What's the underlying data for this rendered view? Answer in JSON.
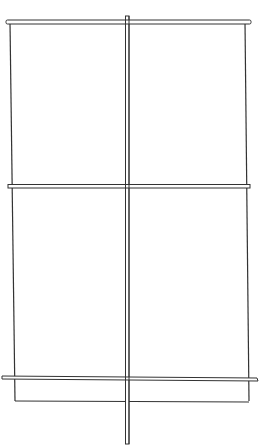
{
  "diagram": {
    "stroke_color": "#333333",
    "background": "#ffffff",
    "frame": {
      "left": 10,
      "right": 246,
      "top": 22,
      "bottom": 401
    },
    "vertical_post": {
      "x": 127.5,
      "y1": 16,
      "y2": 444,
      "width": 3
    },
    "bars": [
      {
        "name": "top-bar",
        "y": 22,
        "x1": 6,
        "x2": 252
      },
      {
        "name": "middle-bar",
        "y": 186,
        "x1": 8,
        "x2": 251
      },
      {
        "name": "lower-bar",
        "y": 378,
        "x1": 2,
        "x2": 258
      }
    ]
  }
}
